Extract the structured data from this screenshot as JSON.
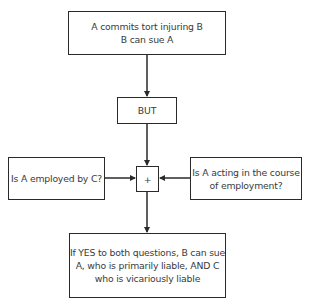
{
  "diagram": {
    "nodes": {
      "tort": {
        "lines": [
          "A commits tort injuring B",
          "B can sue A"
        ]
      },
      "but": {
        "label": "BUT"
      },
      "employed": {
        "label": "Is A employed by C?"
      },
      "join": {
        "label": "+"
      },
      "course": {
        "lines": [
          "Is A acting in the course",
          "of employment?"
        ]
      },
      "result": {
        "lines": [
          "If YES to both questions, B can sue",
          "A, who is primarily liable, AND C",
          "who is vicariously liable"
        ]
      }
    },
    "edges": [
      {
        "from": "tort",
        "to": "but"
      },
      {
        "from": "but",
        "to": "join"
      },
      {
        "from": "employed",
        "to": "join"
      },
      {
        "from": "course",
        "to": "join"
      },
      {
        "from": "join",
        "to": "result"
      }
    ],
    "colors": {
      "line": "#2a2a2a",
      "text": "#3a3a3a",
      "background": "#ffffff"
    }
  }
}
